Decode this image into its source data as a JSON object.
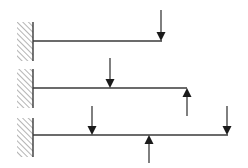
{
  "diagram": {
    "title": "",
    "colors": {
      "line": "#3a3a3a",
      "arrow": "#1a1a1a",
      "hatch": "#6a6a6a",
      "background": "#ffffff"
    },
    "beams": [
      {
        "id": "beam-1",
        "wall": {
          "x": 17,
          "width": 16,
          "y1": 22,
          "y2": 61
        },
        "y": 41,
        "x_start": 33,
        "x_end": 162,
        "loads": [
          {
            "id": "load-1a",
            "direction": "down",
            "x": 161,
            "y_tail": 10,
            "y_tip": 41
          }
        ]
      },
      {
        "id": "beam-2",
        "wall": {
          "x": 17,
          "width": 16,
          "y1": 69,
          "y2": 108
        },
        "y": 88,
        "x_start": 33,
        "x_end": 187,
        "loads": [
          {
            "id": "load-2a",
            "direction": "down",
            "x": 110,
            "y_tail": 58,
            "y_tip": 88
          },
          {
            "id": "load-2b",
            "direction": "up",
            "x": 187,
            "y_tail": 116,
            "y_tip": 88
          }
        ]
      },
      {
        "id": "beam-3",
        "wall": {
          "x": 17,
          "width": 16,
          "y1": 118,
          "y2": 157
        },
        "y": 135,
        "x_start": 33,
        "x_end": 228,
        "loads": [
          {
            "id": "load-3a",
            "direction": "down",
            "x": 92,
            "y_tail": 106,
            "y_tip": 135
          },
          {
            "id": "load-3b",
            "direction": "up",
            "x": 149,
            "y_tail": 163,
            "y_tip": 135
          },
          {
            "id": "load-3c",
            "direction": "down",
            "x": 227,
            "y_tail": 106,
            "y_tip": 135
          }
        ]
      }
    ]
  }
}
